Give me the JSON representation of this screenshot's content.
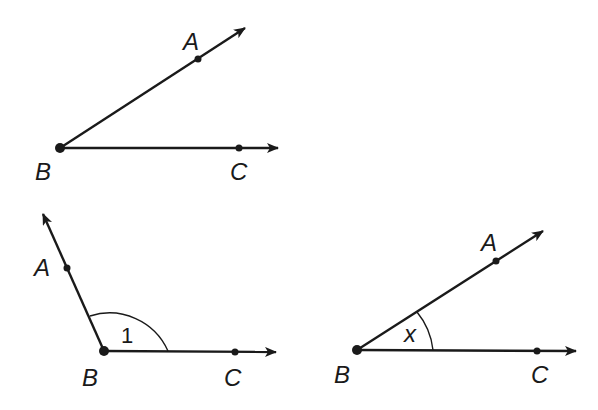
{
  "figures": [
    {
      "id": "angle-abc-acute",
      "vertex": {
        "label": "B",
        "x": 60,
        "y": 148
      },
      "ray_a": {
        "label": "A",
        "point": [
          198,
          59
        ],
        "tip": [
          245,
          28
        ]
      },
      "ray_c": {
        "label": "C",
        "point": [
          239,
          148
        ],
        "tip": [
          278,
          148
        ]
      },
      "labels": {
        "A": "A",
        "B": "B",
        "C": "C"
      },
      "angle_mark": null
    },
    {
      "id": "angle-1-obtuse",
      "vertex": {
        "label": "B",
        "x": 104,
        "y": 351
      },
      "ray_a": {
        "label": "A",
        "point": [
          67,
          268
        ],
        "tip": [
          43,
          214
        ]
      },
      "ray_c": {
        "label": "C",
        "point": [
          235,
          352
        ],
        "tip": [
          276,
          352
        ]
      },
      "labels": {
        "A": "A",
        "B": "B",
        "C": "C"
      },
      "angle_mark": {
        "text": "1",
        "radius": 64
      }
    },
    {
      "id": "angle-x-acute",
      "vertex": {
        "label": "B",
        "x": 357,
        "y": 350
      },
      "ray_a": {
        "label": "A",
        "point": [
          496,
          261
        ],
        "tip": [
          543,
          231
        ]
      },
      "ray_c": {
        "label": "C",
        "point": [
          537,
          351
        ],
        "tip": [
          576,
          351
        ]
      },
      "labels": {
        "A": "A",
        "B": "B",
        "C": "C"
      },
      "angle_mark": {
        "text": "x",
        "radius": 77
      }
    }
  ],
  "text": {
    "f1_A": "A",
    "f1_B": "B",
    "f1_C": "C",
    "f2_A": "A",
    "f2_B": "B",
    "f2_C": "C",
    "f2_angle": "1",
    "f3_A": "A",
    "f3_B": "B",
    "f3_C": "C",
    "f3_angle": "x"
  },
  "colors": {
    "ink": "#1a1a1a",
    "background": "#ffffff"
  }
}
